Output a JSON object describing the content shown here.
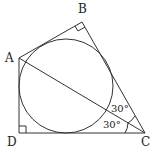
{
  "diagram": {
    "type": "geometry",
    "colors": {
      "stroke": "#333333",
      "background": "#ffffff"
    },
    "vertices": [
      {
        "id": "A",
        "label": "A",
        "x": 19,
        "y": 58
      },
      {
        "id": "B",
        "label": "B",
        "x": 82,
        "y": 22
      },
      {
        "id": "C",
        "label": "C",
        "x": 145,
        "y": 133
      },
      {
        "id": "D",
        "label": "D",
        "x": 19,
        "y": 133
      }
    ],
    "segments": [
      [
        "A",
        "B"
      ],
      [
        "B",
        "C"
      ],
      [
        "C",
        "D"
      ],
      [
        "D",
        "A"
      ],
      [
        "A",
        "C"
      ]
    ],
    "circle": {
      "cx": 66,
      "cy": 86,
      "r": 47
    },
    "right_angles": [
      "B",
      "D"
    ],
    "angles": [
      {
        "at": "C",
        "between": [
          "B",
          "A"
        ],
        "label": "30°"
      },
      {
        "at": "C",
        "between": [
          "A",
          "D"
        ],
        "label": "30°"
      }
    ]
  },
  "labels": {
    "A": "A",
    "B": "B",
    "C": "C",
    "D": "D",
    "angle_bca": "30°",
    "angle_acd": "30°"
  }
}
